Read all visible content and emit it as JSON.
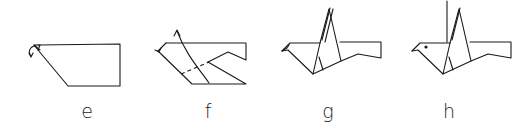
{
  "diagram": {
    "type": "origami-instruction-steps",
    "line_color": "#1a1a1a",
    "steps": [
      {
        "label": "e",
        "description": "folded flat shape with inside-reverse fold arrow at the head tip",
        "label_x": 87
      },
      {
        "label": "f",
        "description": "head formed; dashed valley fold line with arrow lifting the wing up",
        "label_x": 208
      },
      {
        "label": "g",
        "description": "bird with raised wing",
        "label_x": 328
      },
      {
        "label": "h",
        "description": "finished bird with eye dot and second wing raised",
        "label_x": 449
      }
    ]
  }
}
